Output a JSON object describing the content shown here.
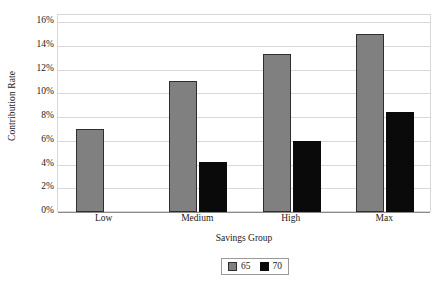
{
  "chart_data": {
    "type": "bar",
    "title": "",
    "xlabel": "Savings Group",
    "ylabel": "Contribution Rate",
    "categories": [
      "Low",
      "Medium",
      "High",
      "Max"
    ],
    "series": [
      {
        "name": "65",
        "color": "#808080",
        "values": [
          7.0,
          11.0,
          13.3,
          15.0
        ]
      },
      {
        "name": "70",
        "color": "#000000",
        "values": [
          null,
          4.2,
          6.0,
          8.4
        ]
      }
    ],
    "ylim": [
      0,
      16
    ],
    "ytick_values": [
      0,
      2,
      4,
      6,
      8,
      10,
      12,
      14,
      16
    ],
    "ytick_labels": [
      "0%",
      "2%",
      "4%",
      "6%",
      "8%",
      "10%",
      "12%",
      "14%",
      "16%"
    ],
    "grid": true,
    "legend_position": "bottom-center",
    "legend_entries": [
      {
        "label": "65",
        "swatch": "gray-swatch"
      },
      {
        "label": "70",
        "swatch": "black-swatch"
      }
    ]
  }
}
